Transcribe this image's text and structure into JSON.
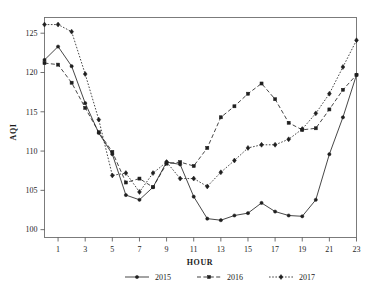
{
  "chart_data": {
    "type": "line",
    "title": "",
    "xlabel": "HOUR",
    "ylabel": "AQI",
    "xlim": [
      0,
      23
    ],
    "ylim": [
      99,
      127
    ],
    "grid": false,
    "legend_position": "bottom",
    "x": [
      0,
      1,
      2,
      3,
      4,
      5,
      6,
      7,
      8,
      9,
      10,
      11,
      12,
      13,
      14,
      15,
      16,
      17,
      18,
      19,
      20,
      21,
      22,
      23
    ],
    "xticks": [
      1,
      3,
      5,
      7,
      9,
      11,
      13,
      15,
      17,
      19,
      21,
      23
    ],
    "xtick_labels": [
      "1",
      "3",
      "5",
      "7",
      "9",
      "11",
      "13",
      "15",
      "17",
      "19",
      "21",
      "23"
    ],
    "yticks": [
      100,
      105,
      110,
      115,
      120,
      125
    ],
    "ytick_labels": [
      "100",
      "105",
      "110",
      "115",
      "120",
      "125"
    ],
    "series": [
      {
        "name": "2015",
        "marker": "circle",
        "line_style": "solid",
        "color": "#262626",
        "values": [
          121.6,
          123.3,
          120.8,
          116.1,
          112.3,
          109.6,
          104.4,
          103.8,
          105.4,
          108.6,
          108.3,
          104.2,
          101.4,
          101.2,
          101.8,
          102.1,
          103.4,
          102.3,
          101.8,
          101.7,
          103.8,
          109.6,
          114.3,
          119.7
        ]
      },
      {
        "name": "2016",
        "marker": "square",
        "line_style": "dashed",
        "color": "#1f1f1f",
        "values": [
          121.2,
          121.0,
          118.7,
          115.5,
          112.4,
          109.9,
          106.0,
          106.5,
          105.4,
          108.4,
          108.6,
          108.1,
          110.4,
          114.3,
          115.7,
          117.3,
          118.6,
          116.6,
          113.6,
          112.7,
          112.9,
          115.3,
          117.8,
          119.7
        ]
      },
      {
        "name": "2017",
        "marker": "diamond",
        "line_style": "dotted",
        "color": "#262626",
        "values": [
          126.1,
          126.1,
          125.2,
          119.8,
          114.0,
          106.9,
          107.2,
          104.8,
          107.2,
          108.6,
          106.5,
          106.5,
          105.5,
          107.3,
          108.8,
          110.4,
          110.8,
          110.8,
          111.5,
          112.8,
          114.8,
          117.3,
          120.7,
          124.1
        ]
      }
    ]
  },
  "legend": {
    "items": [
      {
        "label": "2015"
      },
      {
        "label": "2016"
      },
      {
        "label": "2017"
      }
    ]
  }
}
